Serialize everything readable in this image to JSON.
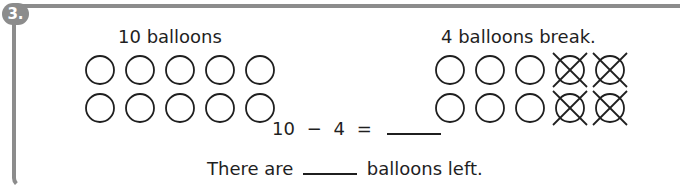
{
  "question": {
    "number": "3.",
    "left_label": "10 balloons",
    "right_label": "4 balloons break.",
    "equation": {
      "left": "10",
      "operator": "−",
      "right": "4",
      "equals": "=",
      "answer": ""
    },
    "sentence": {
      "before": "There are",
      "answer": "",
      "after": "balloons left."
    }
  },
  "left_group": {
    "total": 10,
    "balloons": [
      {
        "broken": false
      },
      {
        "broken": false
      },
      {
        "broken": false
      },
      {
        "broken": false
      },
      {
        "broken": false
      },
      {
        "broken": false
      },
      {
        "broken": false
      },
      {
        "broken": false
      },
      {
        "broken": false
      },
      {
        "broken": false
      }
    ]
  },
  "right_group": {
    "total": 10,
    "broken_count": 4,
    "balloons": [
      {
        "broken": false
      },
      {
        "broken": false
      },
      {
        "broken": false
      },
      {
        "broken": true
      },
      {
        "broken": true
      },
      {
        "broken": false
      },
      {
        "broken": false
      },
      {
        "broken": false
      },
      {
        "broken": true
      },
      {
        "broken": true
      }
    ]
  },
  "colors": {
    "frame": "#8c8c8c",
    "ink": "#1f1f1f",
    "background": "#ffffff"
  }
}
